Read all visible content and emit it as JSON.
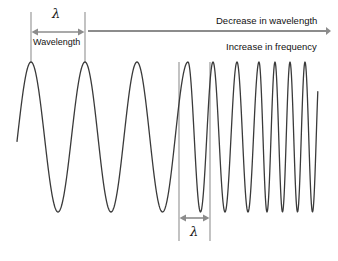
{
  "figure": {
    "width": 338,
    "height": 261,
    "background_color": "#ffffff",
    "wave_color": "#3a3a3a",
    "marker_color": "#8c8c8c",
    "text_color": "#1a1a1a"
  },
  "labels": {
    "lambda_top": "λ",
    "lambda_bottom": "λ",
    "wavelength": "Wavelength",
    "decrease_in_wavelength": "Decrease in wavelength",
    "increase_in_frequency": "Increase in frequency"
  },
  "markers": {
    "left_guide_x1": 31,
    "left_guide_x2": 85,
    "left_guide_y1": 12,
    "left_guide_y2": 63,
    "left_arrow_y": 32,
    "right_guide_x1": 179,
    "right_guide_x2": 210,
    "right_guide_y1": 62,
    "right_guide_y2": 241,
    "right_arrow_y": 218,
    "long_arrow_x1": 88,
    "long_arrow_x2": 331,
    "long_arrow_y": 31
  },
  "chart_data": {
    "type": "line",
    "title": "",
    "subtitle": "",
    "xlabel": "",
    "ylabel": "",
    "xlim": [
      0,
      338
    ],
    "ylim": [
      62,
      212
    ],
    "grid": false,
    "legend": null,
    "annotations": [
      {
        "text": "λ",
        "x": 58,
        "y": 14,
        "role": "wavelength-symbol-long"
      },
      {
        "text": "Wavelength",
        "x": 58,
        "y": 43,
        "role": "wavelength-caption"
      },
      {
        "text": "Decrease in wavelength",
        "x": 273,
        "y": 21,
        "role": "trend-top"
      },
      {
        "text": "Increase in frequency",
        "x": 276,
        "y": 47,
        "role": "trend-bottom"
      },
      {
        "text": "λ",
        "x": 195,
        "y": 231,
        "role": "wavelength-symbol-short"
      }
    ],
    "wave": {
      "amplitude_top_y": 62,
      "amplitude_bottom_y": 212,
      "midline_y": 137,
      "start_x": 17,
      "end_x": 318,
      "long_wavelength_px": 54,
      "short_wavelength_px": 31,
      "peaks_x": [
        31,
        85,
        137,
        188,
        213,
        237,
        259,
        275,
        290,
        305
      ],
      "troughs_x": [
        58,
        111,
        162,
        200,
        225,
        248,
        267,
        283,
        297,
        312
      ],
      "cycles": 10
    }
  }
}
